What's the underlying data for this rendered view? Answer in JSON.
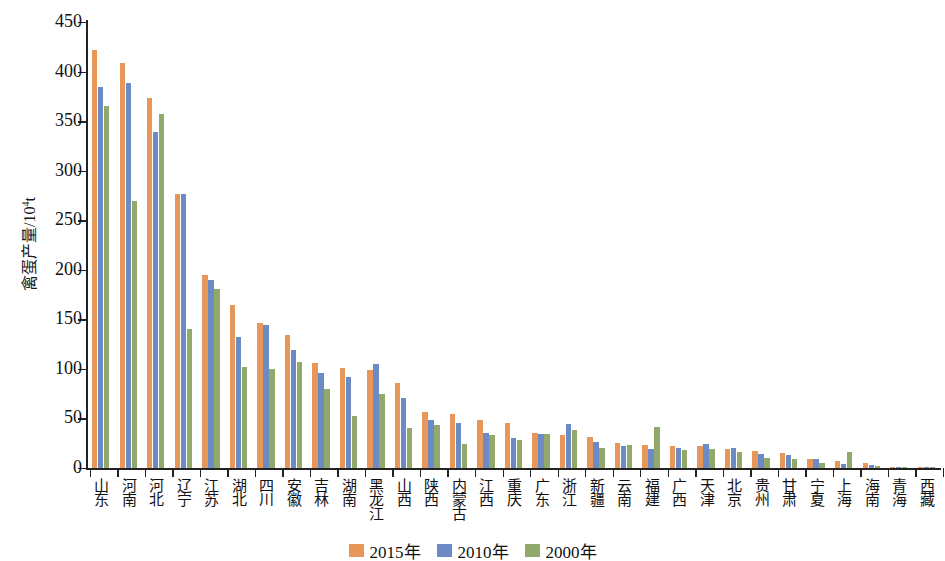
{
  "chart_data": {
    "type": "bar",
    "title": "",
    "xlabel": "",
    "ylabel": "禽蛋产量/10⁴t",
    "ylim": [
      0,
      450
    ],
    "yticks": [
      0,
      50,
      100,
      150,
      200,
      250,
      300,
      350,
      400,
      450
    ],
    "grid": false,
    "legend_position": "bottom-center",
    "categories": [
      "山东",
      "河南",
      "河北",
      "辽宁",
      "江苏",
      "湖北",
      "四川",
      "安徽",
      "吉林",
      "湖南",
      "黑龙江",
      "山西",
      "陕西",
      "内蒙古",
      "江西",
      "重庆",
      "广东",
      "浙江",
      "新疆",
      "云南",
      "福建",
      "广西",
      "天津",
      "北京",
      "贵州",
      "甘肃",
      "宁夏",
      "上海",
      "海南",
      "青海",
      "西藏"
    ],
    "series": [
      {
        "name": "2015年",
        "color": "#e8975a",
        "values": [
          422,
          409,
          373,
          276,
          195,
          164,
          146,
          134,
          106,
          101,
          99,
          86,
          57,
          55,
          48,
          45,
          35,
          33,
          31,
          25,
          23,
          22,
          22,
          19,
          17,
          15,
          9,
          7,
          5,
          1.5,
          0.4
        ]
      },
      {
        "name": "2010年",
        "color": "#6c8bc4",
        "values": [
          384,
          388,
          339,
          276,
          190,
          132,
          144,
          119,
          96,
          92,
          105,
          71,
          48,
          45,
          35,
          30,
          34,
          44,
          26,
          22,
          19,
          20,
          24,
          20,
          14,
          13,
          9,
          4,
          3.5,
          1.2,
          0.3
        ]
      },
      {
        "name": "2000年",
        "color": "#92a96c",
        "values": [
          365,
          269,
          357,
          140,
          181,
          102,
          100,
          107,
          80,
          52,
          75,
          40,
          43,
          24,
          33,
          28,
          34,
          38,
          20,
          23,
          41,
          18,
          19,
          16,
          10,
          9,
          5,
          16,
          1.8,
          0.8,
          0.2
        ]
      }
    ]
  },
  "legend": {
    "items": [
      {
        "label": "2015年",
        "color": "#e8975a"
      },
      {
        "label": "2010年",
        "color": "#6c8bc4"
      },
      {
        "label": "2000年",
        "color": "#92a96c"
      }
    ]
  },
  "axes": {
    "y_title_main": "禽蛋产量/10",
    "y_title_sup": "4",
    "y_title_unit": "t"
  }
}
